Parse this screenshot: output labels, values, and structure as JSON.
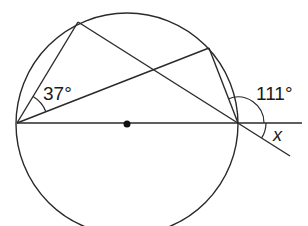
{
  "diagram": {
    "type": "circle-geometry",
    "colors": {
      "stroke": "#2a2a2a",
      "background": "#ffffff",
      "text": "#1a1a1a"
    },
    "circle": {
      "cx": 127,
      "cy": 124,
      "r": 111
    },
    "center_dot": {
      "x": 127,
      "y": 124,
      "r": 3.5
    },
    "points": {
      "left": {
        "x": 17,
        "y": 123
      },
      "top_left": {
        "x": 78,
        "y": 22
      },
      "top_right": {
        "x": 209,
        "y": 48
      },
      "right": {
        "x": 238,
        "y": 123
      }
    },
    "labels": {
      "angle_left": "37°",
      "angle_exterior": "111°",
      "angle_unknown": "x"
    }
  }
}
